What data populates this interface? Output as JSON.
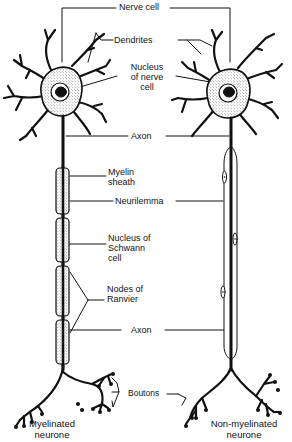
{
  "diagram": {
    "title_labels": {
      "nerve_cell": "Nerve cell",
      "dendrites": "Dendrites",
      "nucleus_of_nerve_cell": "Nucleus\nof nerve\ncell",
      "axon_top": "Axon",
      "myelin_sheath": "Myelin\nsheath",
      "neurilemma": "Neurilemma",
      "nucleus_of_schwann_cell": "Nucleus of\nSchwann\ncell",
      "nodes_of_ranvier": "Nodes of\nRanvier",
      "axon_bottom": "Axon",
      "boutons": "Boutons"
    },
    "captions": {
      "left": "Myelinated\nneurone",
      "right": "Non-myelinated\nneurone"
    },
    "neurons": [
      {
        "name": "myelinated-neurone",
        "myelin_segments": 4
      },
      {
        "name": "non-myelinated-neurone",
        "schwann_nuclei": 3
      }
    ],
    "colors": {
      "ink": "#111111",
      "background": "#ffffff",
      "stipple": "#555555"
    }
  }
}
